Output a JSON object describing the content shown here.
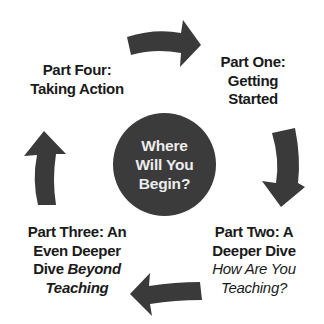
{
  "diagram": {
    "type": "cycle",
    "center": {
      "lines": [
        "Where",
        "Will You",
        "Begin?"
      ]
    },
    "colors": {
      "arrow": "#3a3a3a",
      "circle": "#3b3b3b",
      "circle_text": "#ededed",
      "label_text": "#1a1a1a",
      "background": "#ffffff"
    },
    "parts": [
      {
        "id": "one",
        "lines": [
          "Part One:",
          "Getting",
          "Started"
        ]
      },
      {
        "id": "two",
        "lines": [
          "Part Two: A",
          "Deeper Dive"
        ],
        "italic_lines": [
          "How Are You",
          "Teaching?"
        ]
      },
      {
        "id": "three",
        "lines": [
          "Part Three: An",
          "Even Deeper",
          "Dive"
        ],
        "italic_inline": "Beyond",
        "italic_lines": [
          "Teaching"
        ]
      },
      {
        "id": "four",
        "lines": [
          "Part Four:",
          "Taking Action"
        ]
      }
    ],
    "arrows": [
      {
        "id": "top",
        "direction": "right",
        "icon": "curved-arrow-right-icon"
      },
      {
        "id": "right",
        "direction": "down",
        "icon": "curved-arrow-down-icon"
      },
      {
        "id": "bottom",
        "direction": "left",
        "icon": "curved-arrow-left-icon"
      },
      {
        "id": "left",
        "direction": "up",
        "icon": "curved-arrow-up-icon"
      }
    ]
  }
}
